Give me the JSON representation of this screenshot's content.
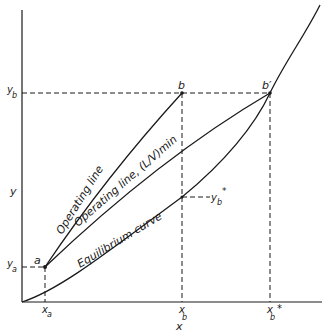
{
  "diagram": {
    "type": "absorption operating/equilibrium line diagram",
    "axes": {
      "x_label": "x",
      "y_label": "y"
    },
    "points": [
      {
        "id": "a",
        "label": "a"
      },
      {
        "id": "b",
        "label": "b"
      },
      {
        "id": "b_prime",
        "label": "b′"
      }
    ],
    "x_ticks": [
      {
        "label": "x",
        "sub": "a"
      },
      {
        "label": "x",
        "sub": "b"
      },
      {
        "label": "x",
        "sub": "b",
        "sup": "*"
      }
    ],
    "y_ticks": [
      {
        "label": "y",
        "sub": "b"
      },
      {
        "label": "y",
        "sub": "a"
      }
    ],
    "annotations": {
      "yb_star": {
        "label": "y",
        "sub": "b",
        "sup": "*"
      }
    },
    "curves": {
      "operating_line": "Operating line",
      "operating_line_min": "Operating line, (L/V)min",
      "equilibrium_curve": "Equilibrium curve"
    },
    "colors": {
      "ink": "#1a1a1a",
      "background": "#ffffff"
    }
  }
}
